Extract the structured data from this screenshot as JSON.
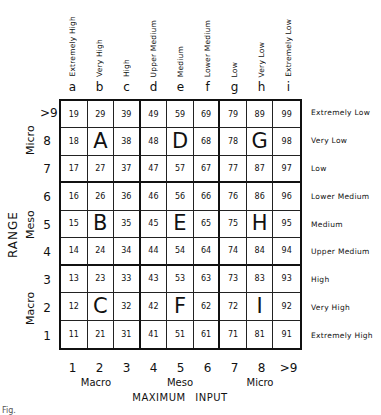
{
  "column_headers": {
    "labels": [
      "Extremely High",
      "Very High",
      "High",
      "Upper Medium",
      "Medium",
      "Lower Medium",
      "Low",
      "Very Low",
      "Extremely Low"
    ],
    "letters": [
      "a",
      "b",
      "c",
      "d",
      "e",
      "f",
      "g",
      "h",
      "i"
    ]
  },
  "row_axis": {
    "title": "RANGE",
    "numbers_top_to_bottom": [
      ">9",
      "8",
      "7",
      "6",
      "5",
      "4",
      "3",
      "2",
      "1"
    ],
    "groups": [
      "Micro",
      "Meso",
      "Macro"
    ]
  },
  "right_labels": [
    "Extremely Low",
    "Very Low",
    "Low",
    "Lower Medium",
    "Medium",
    "Upper Medium",
    "High",
    "Very High",
    "Extremely High"
  ],
  "grid": {
    "rows": [
      [
        "19",
        "29",
        "39",
        "49",
        "59",
        "69",
        "79",
        "89",
        "99"
      ],
      [
        "18",
        "A",
        "38",
        "48",
        "D",
        "68",
        "78",
        "G",
        "98"
      ],
      [
        "17",
        "27",
        "37",
        "47",
        "57",
        "67",
        "77",
        "87",
        "97"
      ],
      [
        "16",
        "26",
        "36",
        "46",
        "56",
        "66",
        "76",
        "86",
        "96"
      ],
      [
        "15",
        "B",
        "35",
        "45",
        "E",
        "65",
        "75",
        "H",
        "95"
      ],
      [
        "14",
        "24",
        "34",
        "44",
        "54",
        "64",
        "74",
        "84",
        "94"
      ],
      [
        "13",
        "23",
        "33",
        "43",
        "53",
        "63",
        "73",
        "83",
        "93"
      ],
      [
        "12",
        "C",
        "32",
        "42",
        "F",
        "62",
        "72",
        "I",
        "92"
      ],
      [
        "11",
        "21",
        "31",
        "41",
        "51",
        "61",
        "71",
        "81",
        "91"
      ]
    ]
  },
  "x_axis": {
    "title": "MAXIMUM INPUT",
    "numbers": [
      "1",
      "2",
      "3",
      "4",
      "5",
      "6",
      "7",
      "8",
      ">9"
    ],
    "groups": [
      "Macro",
      "Meso",
      "Micro"
    ]
  },
  "caption": "Fig."
}
